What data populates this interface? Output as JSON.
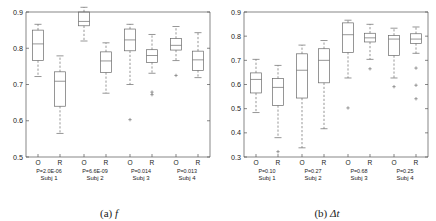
{
  "figure": {
    "panels": [
      {
        "id": "panel-a",
        "caption_index": "(a)",
        "caption_symbol": "f"
      },
      {
        "id": "panel-b",
        "caption_index": "(b)",
        "caption_symbol": "Δt"
      }
    ]
  },
  "chart_data": [
    {
      "type": "box",
      "id": "panel-a",
      "title": "(a) f",
      "xlabel": "",
      "ylabel": "",
      "ylim": [
        0.5,
        0.9
      ],
      "yticks": [
        0.5,
        0.6,
        0.7,
        0.8,
        0.9
      ],
      "ytick_labels": [
        "0.5",
        "0.6",
        "0.7",
        "0.8",
        "0.9"
      ],
      "grid": false,
      "legend": "none",
      "group_labels": [
        "Subj 1",
        "Subj 2",
        "Subj 3",
        "Subj 4"
      ],
      "group_pvalues": [
        "P=2.0E-06",
        "P=6.6E-09",
        "P=0.014",
        "P=0.013"
      ],
      "condition_labels": [
        "O",
        "R"
      ],
      "boxes": [
        {
          "group": "Subj 1",
          "condition": "O",
          "whisker_low": 0.722,
          "q1": 0.766,
          "median": 0.812,
          "q3": 0.85,
          "whisker_high": 0.866,
          "outliers": []
        },
        {
          "group": "Subj 1",
          "condition": "R",
          "whisker_low": 0.565,
          "q1": 0.64,
          "median": 0.709,
          "q3": 0.735,
          "whisker_high": 0.779,
          "outliers": []
        },
        {
          "group": "Subj 2",
          "condition": "O",
          "whisker_low": 0.82,
          "q1": 0.862,
          "median": 0.874,
          "q3": 0.9,
          "whisker_high": 0.913,
          "outliers": []
        },
        {
          "group": "Subj 2",
          "condition": "R",
          "whisker_low": 0.676,
          "q1": 0.733,
          "median": 0.765,
          "q3": 0.79,
          "whisker_high": 0.815,
          "outliers": []
        },
        {
          "group": "Subj 3",
          "condition": "O",
          "whisker_low": 0.7,
          "q1": 0.793,
          "median": 0.823,
          "q3": 0.853,
          "whisker_high": 0.866,
          "outliers": [
            0.603
          ]
        },
        {
          "group": "Subj 3",
          "condition": "R",
          "whisker_low": 0.731,
          "q1": 0.761,
          "median": 0.78,
          "q3": 0.796,
          "whisker_high": 0.838,
          "outliers": [
            0.679,
            0.672
          ]
        },
        {
          "group": "Subj 4",
          "condition": "O",
          "whisker_low": 0.766,
          "q1": 0.795,
          "median": 0.808,
          "q3": 0.827,
          "whisker_high": 0.86,
          "outliers": [
            0.725
          ]
        },
        {
          "group": "Subj 4",
          "condition": "R",
          "whisker_low": 0.719,
          "q1": 0.739,
          "median": 0.768,
          "q3": 0.792,
          "whisker_high": 0.843,
          "outliers": []
        }
      ]
    },
    {
      "type": "box",
      "id": "panel-b",
      "title": "(b) Δt",
      "xlabel": "",
      "ylabel": "",
      "ylim": [
        0.3,
        0.9
      ],
      "yticks": [
        0.3,
        0.4,
        0.5,
        0.6,
        0.7,
        0.8,
        0.9
      ],
      "ytick_labels": [
        "0.3",
        "0.4",
        "0.5",
        "0.6",
        "0.7",
        "0.8",
        "0.9"
      ],
      "grid": false,
      "legend": "none",
      "group_labels": [
        "Subj 1",
        "Subj 2",
        "Subj 3",
        "Subj 4"
      ],
      "group_pvalues": [
        "P=0.10",
        "P=0.27",
        "P=0.68",
        "P=0.25"
      ],
      "condition_labels": [
        "O",
        "R"
      ],
      "boxes": [
        {
          "group": "Subj 1",
          "condition": "O",
          "whisker_low": 0.484,
          "q1": 0.565,
          "median": 0.621,
          "q3": 0.648,
          "whisker_high": 0.704,
          "outliers": []
        },
        {
          "group": "Subj 1",
          "condition": "R",
          "whisker_low": 0.38,
          "q1": 0.513,
          "median": 0.588,
          "q3": 0.625,
          "whisker_high": 0.679,
          "outliers": [
            0.322
          ]
        },
        {
          "group": "Subj 2",
          "condition": "O",
          "whisker_low": 0.338,
          "q1": 0.544,
          "median": 0.659,
          "q3": 0.727,
          "whisker_high": 0.763,
          "outliers": []
        },
        {
          "group": "Subj 2",
          "condition": "R",
          "whisker_low": 0.417,
          "q1": 0.607,
          "median": 0.7,
          "q3": 0.748,
          "whisker_high": 0.782,
          "outliers": []
        },
        {
          "group": "Subj 3",
          "condition": "O",
          "whisker_low": 0.627,
          "q1": 0.733,
          "median": 0.806,
          "q3": 0.855,
          "whisker_high": 0.866,
          "outliers": [
            0.503
          ]
        },
        {
          "group": "Subj 3",
          "condition": "R",
          "whisker_low": 0.704,
          "q1": 0.776,
          "median": 0.793,
          "q3": 0.812,
          "whisker_high": 0.849,
          "outliers": [
            0.665
          ]
        },
        {
          "group": "Subj 4",
          "condition": "O",
          "whisker_low": 0.627,
          "q1": 0.72,
          "median": 0.788,
          "q3": 0.803,
          "whisker_high": 0.833,
          "outliers": [
            0.591
          ]
        },
        {
          "group": "Subj 4",
          "condition": "R",
          "whisker_low": 0.729,
          "q1": 0.77,
          "median": 0.788,
          "q3": 0.81,
          "whisker_high": 0.838,
          "outliers": [
            0.668,
            0.597,
            0.541
          ]
        }
      ]
    }
  ]
}
